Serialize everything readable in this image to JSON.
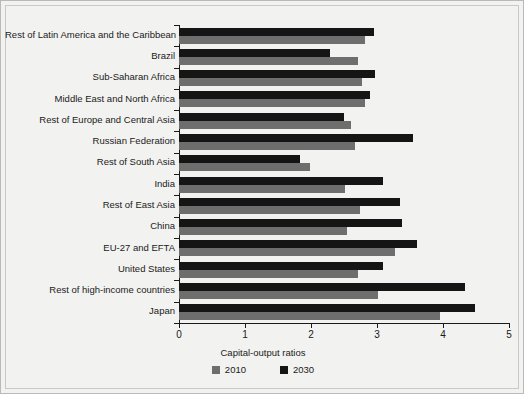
{
  "chart_data": {
    "type": "bar",
    "orientation": "horizontal",
    "title": "",
    "xlabel": "Capital-output ratios",
    "ylabel": "",
    "xlim": [
      0,
      5
    ],
    "xticks": [
      "0",
      "1",
      "2",
      "3",
      "4",
      "5"
    ],
    "grid": false,
    "legend_position": "bottom",
    "legend_title": "Capital-output ratios",
    "categories": [
      "Rest of Latin America and the Caribbean",
      "Brazil",
      "Sub-Saharan Africa",
      "Middle East and North Africa",
      "Rest of Europe and Central Asia",
      "Russian Federation",
      "Rest of South Asia",
      "India",
      "Rest of East Asia",
      "China",
      "EU-27 and EFTA",
      "United States",
      "Rest of high-income countries",
      "Japan"
    ],
    "series": [
      {
        "name": "2010",
        "color": "#6e6e6e",
        "values": [
          2.82,
          2.71,
          2.78,
          2.82,
          2.61,
          2.66,
          1.99,
          2.52,
          2.74,
          2.55,
          3.28,
          2.71,
          3.02,
          3.96
        ]
      },
      {
        "name": "2030",
        "color": "#151515",
        "values": [
          2.96,
          2.29,
          2.97,
          2.9,
          2.5,
          3.54,
          1.84,
          3.09,
          3.35,
          3.38,
          3.61,
          3.09,
          4.34,
          4.48
        ]
      }
    ]
  },
  "colors": {
    "background": "#f2f2f0",
    "axis": "#1a1a1a",
    "series_2010": "#6e6e6e",
    "series_2030": "#151515"
  }
}
